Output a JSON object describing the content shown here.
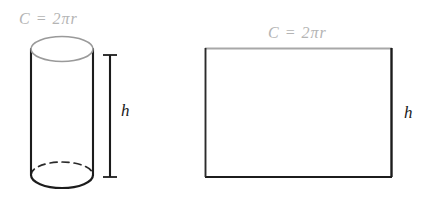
{
  "figure": {
    "background_color": "#ffffff",
    "width": 432,
    "height": 206,
    "label_color_circumference": "#b4b4b4",
    "label_color_height": "#1c1c1c",
    "stroke_color_dark": "#1c1c1c",
    "stroke_color_light": "#9a9a9a"
  },
  "labels": {
    "circumference_cylinder": "C = 2πr",
    "circumference_rectangle": "C = 2πr",
    "height_cylinder": "h",
    "height_rectangle": "h",
    "circumference_variable": "C",
    "circumference_equals": "=",
    "circumference_expression": "2πr"
  },
  "shapes": {
    "cylinder": {
      "name": "cylinder",
      "left": 31,
      "right": 93,
      "top_ellipse_center_y": 49,
      "bottom_ellipse_center_y": 175,
      "ellipse_radius_x": 31,
      "ellipse_radius_y": 13,
      "top_face_stroke": "#9a9a9a",
      "side_stroke": "#1c1c1c",
      "hidden_edge_style": "dashed"
    },
    "dimension_line_cylinder": {
      "name": "height-dimension-line",
      "x": 110,
      "y_top": 55,
      "y_bottom": 177,
      "cap_half_width": 7
    },
    "rectangle": {
      "name": "unrolled-lateral-rectangle",
      "left": 205,
      "top": 48,
      "right": 392,
      "bottom": 177,
      "width": 187,
      "height": 129,
      "top_stroke": "#a8a8a8",
      "other_stroke": "#1c1c1c"
    }
  }
}
